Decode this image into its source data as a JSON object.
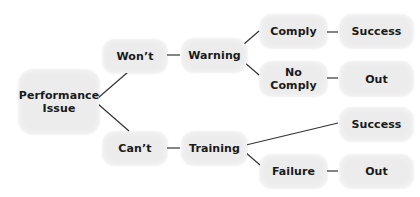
{
  "diagram": {
    "type": "decision-tree",
    "colors": {
      "node_fill": "#ececec",
      "text": "#1a1a1a",
      "connector": "#333333",
      "background": "#ffffff"
    },
    "nodes": {
      "root": {
        "line1": "Performance",
        "line2": "Issue"
      },
      "wont": {
        "label": "Won’t"
      },
      "cant": {
        "label": "Can’t"
      },
      "warning": {
        "label": "Warning"
      },
      "training": {
        "label": "Training"
      },
      "comply": {
        "label": "Comply"
      },
      "no_comply": {
        "line1": "No",
        "line2": "Comply"
      },
      "success_top": {
        "label": "Success"
      },
      "out_top": {
        "label": "Out"
      },
      "success_bottom": {
        "label": "Success"
      },
      "failure": {
        "label": "Failure"
      },
      "out_bottom": {
        "label": "Out"
      }
    },
    "edges": [
      [
        "Performance Issue",
        "Won’t"
      ],
      [
        "Performance Issue",
        "Can’t"
      ],
      [
        "Won’t",
        "Warning"
      ],
      [
        "Warning",
        "Comply"
      ],
      [
        "Warning",
        "No Comply"
      ],
      [
        "Comply",
        "Success"
      ],
      [
        "No Comply",
        "Out"
      ],
      [
        "Can’t",
        "Training"
      ],
      [
        "Training",
        "Success"
      ],
      [
        "Training",
        "Failure"
      ],
      [
        "Failure",
        "Out"
      ]
    ]
  }
}
